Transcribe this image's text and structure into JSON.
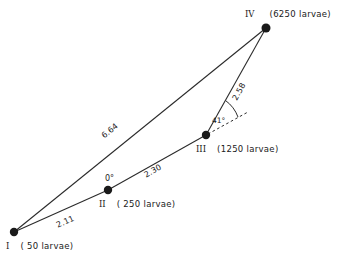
{
  "figure": {
    "background_color": "#ffffff",
    "line_color": "#2b2b2b",
    "text_color": "#1a1a1a"
  },
  "nodes": [
    {
      "id": "I",
      "roman": "I",
      "caption": "( 50 larvae)",
      "count": 50,
      "x": 14,
      "y": 232
    },
    {
      "id": "II",
      "roman": "II",
      "caption": "( 250 larvae)",
      "count": 250,
      "x": 108,
      "y": 190
    },
    {
      "id": "III",
      "roman": "III",
      "caption": "(1250 larvae)",
      "count": 1250,
      "x": 206,
      "y": 135
    },
    {
      "id": "IV",
      "roman": "IV",
      "caption": "(6250 larvae)",
      "count": 6250,
      "x": 266,
      "y": 28
    }
  ],
  "edges": [
    {
      "from": "I",
      "to": "II",
      "label": "2.11",
      "value": 2.11
    },
    {
      "from": "II",
      "to": "III",
      "label": "2.30",
      "value": 2.3
    },
    {
      "from": "III",
      "to": "IV",
      "label": "2.58",
      "value": 2.58
    },
    {
      "from": "I",
      "to": "IV",
      "label": "6.64",
      "value": 6.64
    }
  ],
  "angles": [
    {
      "at": "II",
      "label": "0°",
      "value": 0
    },
    {
      "at": "III",
      "label": "41°",
      "value": 41
    }
  ]
}
